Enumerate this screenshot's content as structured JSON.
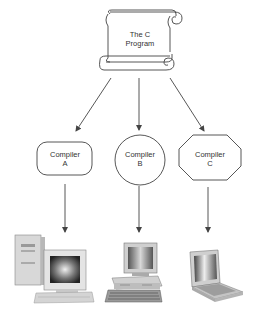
{
  "diagram": {
    "type": "compilation-flow",
    "source": {
      "shape": "scroll",
      "line1": "The C",
      "line2": "Program"
    },
    "compilers": [
      {
        "shape": "rounded-rectangle",
        "line1": "Compiler",
        "line2": "A"
      },
      {
        "shape": "circle",
        "line1": "Compiler",
        "line2": "B"
      },
      {
        "shape": "octagon",
        "line1": "Compiler",
        "line2": "C"
      }
    ],
    "targets": [
      {
        "icon": "tower-desktop-computer-icon"
      },
      {
        "icon": "desktop-computer-icon"
      },
      {
        "icon": "laptop-computer-icon"
      }
    ],
    "colors": {
      "stroke": "#444444",
      "text": "#333333",
      "background": "#ffffff"
    }
  }
}
